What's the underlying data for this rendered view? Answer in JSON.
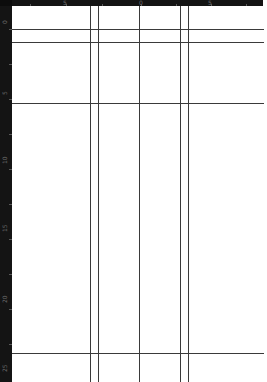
{
  "rulers": {
    "top": {
      "labels": [
        {
          "text": "5",
          "x": 63
        },
        {
          "text": "0",
          "x": 139
        },
        {
          "text": "5",
          "x": 208
        }
      ]
    },
    "left": {
      "labels": [
        {
          "text": "0",
          "y": 24
        },
        {
          "text": "5",
          "y": 95
        },
        {
          "text": "10",
          "y": 164
        },
        {
          "text": "15",
          "y": 232
        },
        {
          "text": "20",
          "y": 303
        },
        {
          "text": "25",
          "y": 372
        }
      ]
    }
  },
  "guides": {
    "horizontal": [
      29,
      42,
      103,
      353
    ],
    "vertical": [
      90,
      98,
      139,
      180,
      188
    ]
  },
  "colors": {
    "ruler_bg": "#141414",
    "ruler_text": "#6e6e6e",
    "canvas_bg": "#ffffff",
    "guide": "#3a3a3a"
  }
}
